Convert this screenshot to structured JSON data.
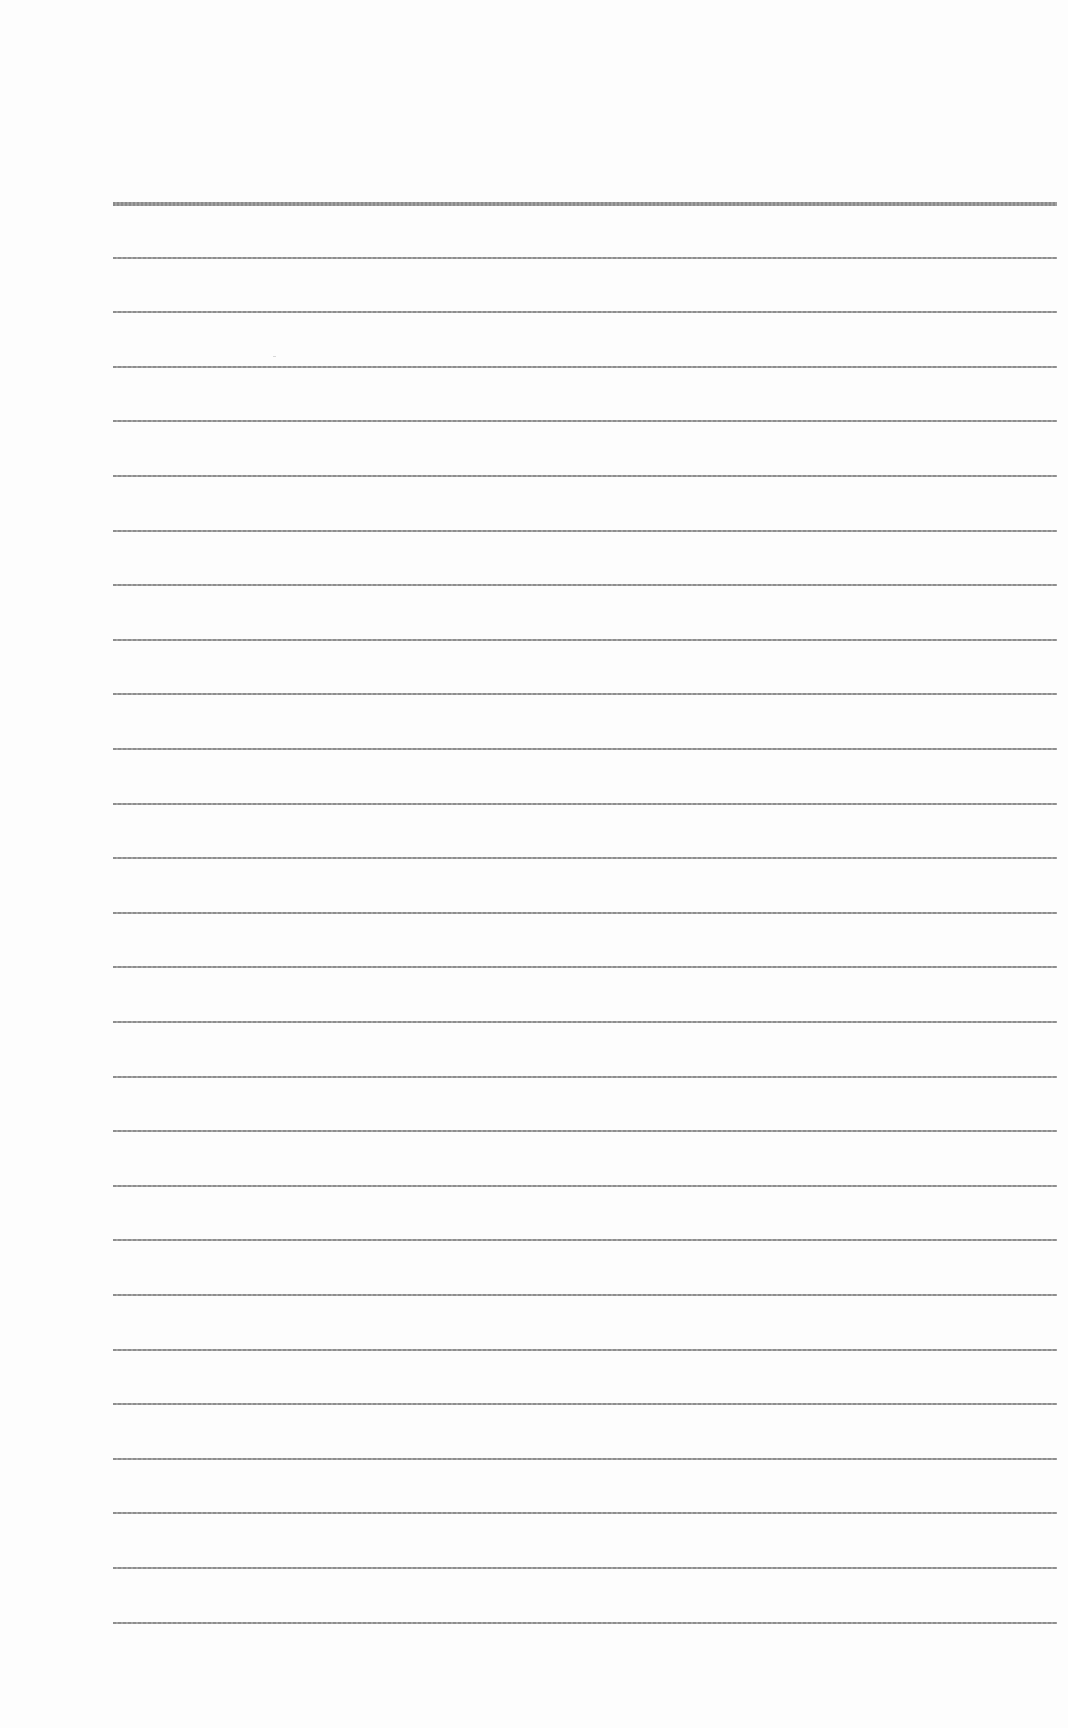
{
  "page": {
    "type": "ruled-paper",
    "background_color": "#fdfdfd",
    "line_color": "#8e8e8e",
    "line_count": 27,
    "first_line_y": 202,
    "line_spacing": 54.6,
    "line_left": 113,
    "line_right": 1057,
    "header_line_thick": true
  },
  "bleed_through_text": {
    "line1": "",
    "line2": ""
  }
}
